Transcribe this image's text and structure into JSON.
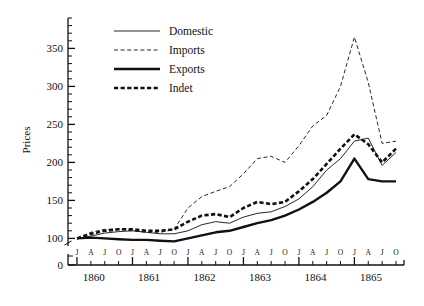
{
  "chart_data": {
    "type": "line",
    "title": "",
    "xlabel": "",
    "ylabel": "Prices",
    "ylim": [
      90,
      390
    ],
    "ytick_labels": [
      "0",
      "100",
      "150",
      "200",
      "250",
      "300",
      "350"
    ],
    "ymajor_ticks": [
      100,
      150,
      200,
      250,
      300,
      350
    ],
    "yminor_step": 10,
    "zero_break": true,
    "grid": false,
    "legend_position": "top-center",
    "x_month_labels": [
      "J",
      "A",
      "J",
      "O",
      "J",
      "A",
      "J",
      "O",
      "J",
      "A",
      "J",
      "O",
      "J",
      "A",
      "J",
      "O",
      "J",
      "A",
      "J",
      "O",
      "J",
      "A",
      "J",
      "O"
    ],
    "x_year_labels": [
      "1860",
      "1861",
      "1862",
      "1863",
      "1864",
      "1865"
    ],
    "x": [
      "1860-J",
      "1860-A",
      "1860-J2",
      "1860-O",
      "1861-J",
      "1861-A",
      "1861-J2",
      "1861-O",
      "1862-J",
      "1862-A",
      "1862-J2",
      "1862-O",
      "1863-J",
      "1863-A",
      "1863-J2",
      "1863-O",
      "1864-J",
      "1864-A",
      "1864-J2",
      "1864-O",
      "1865-J",
      "1865-A",
      "1865-J2",
      "1865-O"
    ],
    "series": [
      {
        "name": "Domestic",
        "style": "thin-solid",
        "color": "#111111",
        "values": [
          100,
          103,
          107,
          109,
          110,
          108,
          106,
          106,
          110,
          118,
          122,
          120,
          128,
          133,
          135,
          142,
          152,
          168,
          190,
          205,
          228,
          232,
          196,
          213
        ]
      },
      {
        "name": "Imports",
        "style": "thin-dashed",
        "color": "#111111",
        "values": [
          100,
          108,
          112,
          112,
          110,
          108,
          108,
          112,
          140,
          155,
          162,
          168,
          185,
          205,
          208,
          200,
          222,
          248,
          262,
          300,
          365,
          305,
          225,
          228
        ]
      },
      {
        "name": "Exports",
        "style": "thick-solid",
        "color": "#111111",
        "values": [
          100,
          101,
          100,
          99,
          98,
          98,
          97,
          96,
          100,
          104,
          108,
          110,
          115,
          120,
          124,
          130,
          138,
          148,
          160,
          175,
          205,
          178,
          175,
          175
        ]
      },
      {
        "name": "Indet",
        "style": "thick-dashed",
        "color": "#111111",
        "values": [
          100,
          106,
          110,
          112,
          112,
          110,
          110,
          112,
          122,
          130,
          132,
          128,
          140,
          148,
          145,
          148,
          162,
          178,
          198,
          218,
          237,
          224,
          200,
          218
        ]
      }
    ]
  },
  "legend": {
    "items": [
      {
        "label": "Domestic",
        "style": "thin-solid"
      },
      {
        "label": "Imports",
        "style": "thin-dashed"
      },
      {
        "label": "Exports",
        "style": "thick-solid"
      },
      {
        "label": "Indet",
        "style": "thick-dashed"
      }
    ]
  },
  "axis": {
    "y_title": "Prices"
  }
}
